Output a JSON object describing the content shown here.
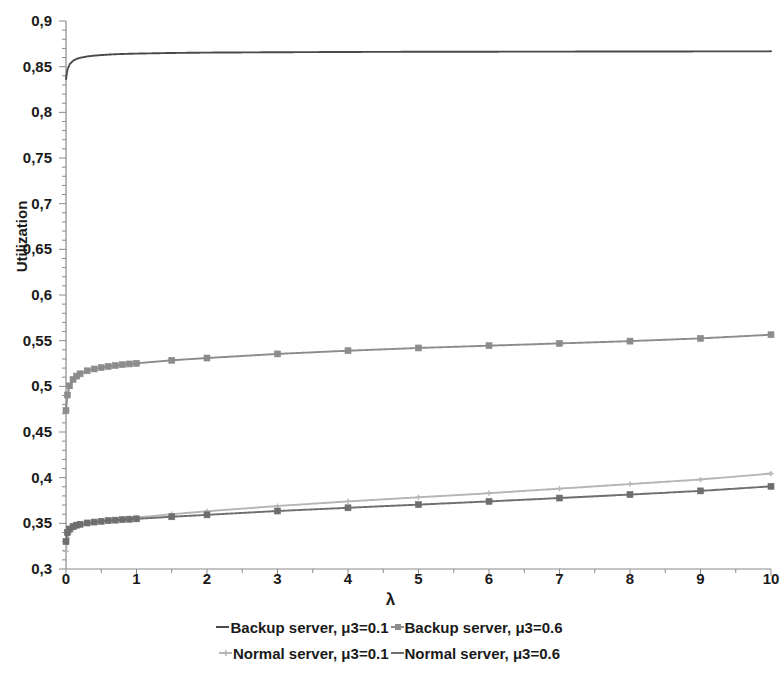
{
  "chart_data": {
    "type": "line",
    "title": "",
    "xlabel": "λ",
    "ylabel": "Utilization",
    "xlim": [
      0,
      10
    ],
    "ylim": [
      0.3,
      0.9
    ],
    "xticks": [
      "0",
      "1",
      "2",
      "3",
      "4",
      "5",
      "6",
      "7",
      "8",
      "9",
      "10"
    ],
    "yticks": [
      "0,9",
      "0,85",
      "0,8",
      "0,75",
      "0,7",
      "0,65",
      "0,6",
      "0,55",
      "0,5",
      "0,45",
      "0,4",
      "0,35",
      "0,3"
    ],
    "grid": false,
    "legend_position": "bottom",
    "x": [
      0,
      0.02,
      0.05,
      0.1,
      0.15,
      0.2,
      0.3,
      0.4,
      0.5,
      0.6,
      0.7,
      0.8,
      0.9,
      1,
      1.5,
      2,
      3,
      4,
      5,
      6,
      7,
      8,
      9,
      10
    ],
    "series": [
      {
        "name": "Backup server, μ3=0.1",
        "color": "#4a4a4a",
        "marker": "none",
        "values": [
          0.8365,
          0.8465,
          0.8525,
          0.8565,
          0.8585,
          0.8597,
          0.8612,
          0.8621,
          0.8627,
          0.8632,
          0.8636,
          0.8639,
          0.8641,
          0.8643,
          0.865,
          0.8654,
          0.8658,
          0.8661,
          0.8663,
          0.8664,
          0.8665,
          0.8666,
          0.8667,
          0.8668
        ]
      },
      {
        "name": "Backup server, μ3=0.6",
        "color": "#8c8c8c",
        "marker": "square",
        "values": [
          0.4735,
          0.4905,
          0.5005,
          0.5075,
          0.5112,
          0.5137,
          0.517,
          0.519,
          0.5205,
          0.5218,
          0.5228,
          0.5237,
          0.5245,
          0.5252,
          0.5285,
          0.531,
          0.5355,
          0.539,
          0.542,
          0.5445,
          0.547,
          0.5495,
          0.5525,
          0.5565
        ]
      },
      {
        "name": "Normal server, μ3=0.1",
        "color": "#b5b5b5",
        "marker": "cross",
        "values": [
          0.3195,
          0.334,
          0.3395,
          0.3435,
          0.3458,
          0.3474,
          0.3496,
          0.3511,
          0.3523,
          0.3533,
          0.3542,
          0.355,
          0.3557,
          0.3563,
          0.36,
          0.3632,
          0.369,
          0.374,
          0.3785,
          0.383,
          0.388,
          0.393,
          0.398,
          0.4045
        ]
      },
      {
        "name": "Normal server, μ3=0.6",
        "color": "#6e6e6e",
        "marker": "square",
        "values": [
          0.33,
          0.34,
          0.3438,
          0.3465,
          0.348,
          0.349,
          0.3504,
          0.3514,
          0.3522,
          0.3529,
          0.3535,
          0.354,
          0.3545,
          0.3549,
          0.3572,
          0.3593,
          0.3635,
          0.367,
          0.3705,
          0.374,
          0.3777,
          0.3815,
          0.3855,
          0.3905
        ]
      }
    ]
  },
  "axes": {
    "y_title": "Utilization",
    "x_title": "λ",
    "y_tick_labels": [
      "0,9",
      "0,85",
      "0,8",
      "0,75",
      "0,7",
      "0,65",
      "0,6",
      "0,55",
      "0,5",
      "0,45",
      "0,4",
      "0,35",
      "0,3"
    ],
    "x_tick_labels": [
      "0",
      "1",
      "2",
      "3",
      "4",
      "5",
      "6",
      "7",
      "8",
      "9",
      "10"
    ]
  },
  "legend": {
    "row1": [
      {
        "label": "Backup server, μ3=0.1",
        "color": "#4a4a4a",
        "marker": "none"
      },
      {
        "label": "Backup server, μ3=0.6",
        "color": "#8c8c8c",
        "marker": "square"
      }
    ],
    "row2": [
      {
        "label": "Normal server, μ3=0.1",
        "color": "#b5b5b5",
        "marker": "cross"
      },
      {
        "label": "Normal server, μ3=0.6",
        "color": "#6e6e6e",
        "marker": "none"
      }
    ]
  },
  "title": {
    "text": ""
  }
}
